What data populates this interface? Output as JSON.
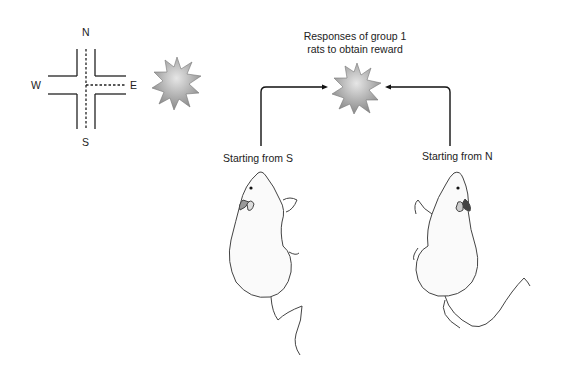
{
  "maze": {
    "labels": {
      "north": "N",
      "south": "S",
      "west": "W",
      "east": "E"
    },
    "path_style": "dashed",
    "path_description": "S to center then to E"
  },
  "reward_icon": "star-burst-icon",
  "diagram": {
    "title_line1": "Responses of group 1",
    "title_line2": "rats to obtain reward",
    "left_label": "Starting from S",
    "right_label": "Starting from N"
  },
  "colors": {
    "line": "#222222",
    "star_light": "#d8d8d8",
    "star_dark": "#8a8a8a",
    "rat_outline": "#444444"
  }
}
